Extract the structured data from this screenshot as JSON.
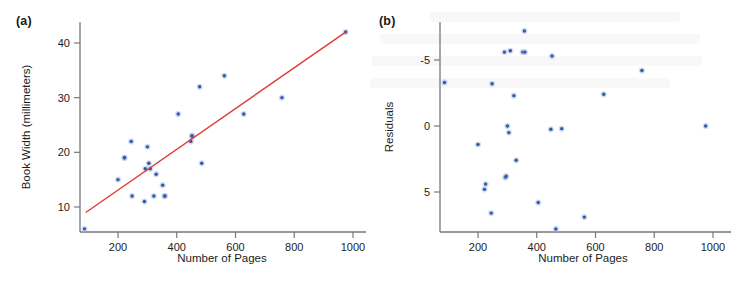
{
  "figure": {
    "panels": [
      {
        "label": "(a)",
        "xlabel": "Number of Pages",
        "ylabel": "Book Width (millimeters)"
      },
      {
        "label": "(b)",
        "xlabel": "Number of Pages",
        "ylabel": "Residuals"
      }
    ],
    "colors": {
      "point": "#3257a8",
      "fit_line": "#e03a30",
      "axis": "#77787b",
      "text": "#1d1d1d",
      "background": "#ffffff"
    }
  },
  "chart_data": [
    {
      "type": "scatter",
      "panel": "(a)",
      "title": "",
      "xlabel": "Number of Pages",
      "ylabel": "Book Width (millimeters)",
      "xlim": [
        60,
        1040
      ],
      "ylim": [
        5,
        43
      ],
      "xticks": [
        200,
        400,
        600,
        800,
        1000
      ],
      "yticks": [
        10,
        20,
        30,
        40
      ],
      "grid": false,
      "legend": null,
      "x": [
        86,
        200,
        222,
        222,
        245,
        248,
        290,
        293,
        300,
        305,
        310,
        322,
        330,
        352,
        358,
        360,
        405,
        448,
        452,
        452,
        478,
        485,
        562,
        628,
        758,
        975
      ],
      "y": [
        6,
        15,
        19,
        19,
        22,
        12,
        11,
        17,
        21,
        18,
        17,
        12,
        16,
        14,
        12,
        12,
        27,
        22,
        23,
        23,
        32,
        18,
        34,
        27,
        30,
        42
      ],
      "fit_line": {
        "type": "line",
        "label": "least-squares regression line",
        "x": [
          90,
          975
        ],
        "y": [
          9.0,
          42.0
        ]
      }
    },
    {
      "type": "scatter",
      "panel": "(b)",
      "title": "",
      "xlabel": "Number of Pages",
      "ylabel": "Residuals",
      "xlim": [
        60,
        1040
      ],
      "ylim": [
        -7.8,
        8.2
      ],
      "xticks": [
        200,
        400,
        600,
        800,
        1000
      ],
      "yticks": [
        -5,
        0,
        5
      ],
      "grid": false,
      "legend": null,
      "x": [
        86,
        200,
        222,
        226,
        245,
        248,
        290,
        293,
        296,
        300,
        305,
        310,
        322,
        330,
        352,
        358,
        360,
        405,
        448,
        452,
        465,
        485,
        562,
        628,
        758,
        975
      ],
      "y": [
        -3.3,
        1.4,
        4.8,
        4.4,
        6.6,
        -3.2,
        -5.6,
        3.9,
        3.8,
        0.0,
        0.5,
        -5.7,
        -2.3,
        2.6,
        -5.6,
        -7.2,
        -5.6,
        5.8,
        0.25,
        -5.3,
        7.8,
        0.2,
        6.9,
        -2.4,
        -4.2,
        0.0
      ]
    }
  ]
}
